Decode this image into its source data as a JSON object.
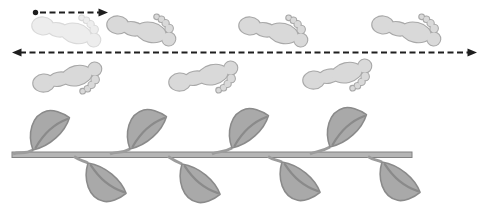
{
  "figure": {
    "width": 487,
    "height": 205,
    "background": "#ffffff"
  },
  "colors": {
    "arrow": "#1e1e1e",
    "footprint_fill": "#d9d9d9",
    "footprint_outline": "#a8a8a8",
    "footprint_faded_fill": "#ededed",
    "footprint_faded_outline": "#d9d9d9",
    "leaf_fill": "#a9a9a9",
    "leaf_outline": "#8a8a8a",
    "petiole": "#9c9c9c",
    "stem_fill": "#b5b5b5",
    "stem_outline": "#828282"
  },
  "arrows": [
    {
      "name": "pace-arrow",
      "y": 12.5,
      "x1": 35.5,
      "x2": 108,
      "start_cap": "dot",
      "end_cap": "arrow",
      "dash": "6 3.5",
      "line_x1": 40,
      "line_x2": 99
    },
    {
      "name": "full-span-arrow",
      "y": 52.5,
      "x1": 12,
      "x2": 477,
      "start_cap": "arrow",
      "end_cap": "arrow",
      "dash": "6 3.5",
      "line_x1": 20,
      "line_x2": 469
    }
  ],
  "footprint_rows": [
    {
      "name": "top-row",
      "toe_side": "bottom",
      "items": [
        {
          "x": 66,
          "y": 30,
          "faded": true
        },
        {
          "x": 141,
          "y": 29,
          "faded": false
        },
        {
          "x": 273,
          "y": 30,
          "faded": false
        },
        {
          "x": 406,
          "y": 29,
          "faded": false
        }
      ]
    },
    {
      "name": "bottom-row",
      "toe_side": "top",
      "items": [
        {
          "x": 67,
          "y": 79,
          "faded": false
        },
        {
          "x": 203,
          "y": 78,
          "faded": false
        },
        {
          "x": 337,
          "y": 76,
          "faded": false
        }
      ]
    }
  ],
  "vine": {
    "stem": {
      "x1": 12,
      "x2": 412,
      "y": 152,
      "height": 5.5
    },
    "upper_leaves": [
      {
        "base_x": 33,
        "base_y": 150
      },
      {
        "base_x": 130,
        "base_y": 149
      },
      {
        "base_x": 232,
        "base_y": 148
      },
      {
        "base_x": 330,
        "base_y": 147
      }
    ],
    "lower_leaves": [
      {
        "base_x": 88,
        "base_y": 163
      },
      {
        "base_x": 182,
        "base_y": 164
      },
      {
        "base_x": 282,
        "base_y": 162
      },
      {
        "base_x": 382,
        "base_y": 162
      }
    ]
  }
}
